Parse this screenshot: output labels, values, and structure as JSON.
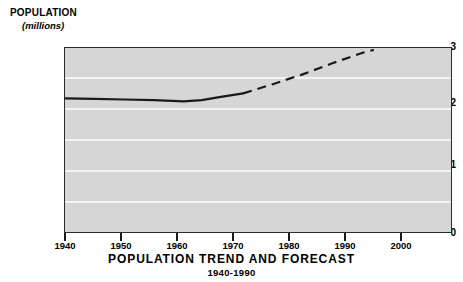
{
  "chart_data": {
    "type": "line",
    "title": "POPULATION TREND AND FORECAST",
    "subtitle": "1940-1990",
    "ylabel": "POPULATION",
    "yunits": "(millions)",
    "xlabel": "",
    "xlim": [
      1940,
      2005
    ],
    "ylim": [
      0,
      3
    ],
    "grid": true,
    "legend": "none",
    "y_ticks_major": [
      0,
      1,
      2,
      3
    ],
    "y_ticks_minor": [
      0.5,
      1.5,
      2.5
    ],
    "y_tick_labels": [
      "0",
      "1",
      "2",
      "3"
    ],
    "x_ticks": [
      1940,
      1950,
      1960,
      1970,
      1980,
      1990,
      2000
    ],
    "x_tick_labels": [
      "1940",
      "1950",
      "1960",
      "1970",
      "1980",
      "1990",
      "2000"
    ],
    "series": [
      {
        "name": "Historical trend",
        "style": "solid",
        "x": [
          1940,
          1945,
          1950,
          1955,
          1960,
          1963,
          1966,
          1970
        ],
        "values": [
          2.18,
          2.17,
          2.16,
          2.15,
          2.13,
          2.15,
          2.2,
          2.26
        ]
      },
      {
        "name": "Forecast",
        "style": "dashed",
        "x": [
          1970,
          1975,
          1980,
          1985,
          1990,
          1992
        ],
        "values": [
          2.26,
          2.41,
          2.57,
          2.75,
          2.92,
          2.97
        ]
      }
    ],
    "colors": {
      "plot_background": "#d6d6d6",
      "gridline": "#f4f4f4",
      "line": "#1a1a1a",
      "axis": "#2b2b2b",
      "page_background": "#ffffff"
    }
  }
}
